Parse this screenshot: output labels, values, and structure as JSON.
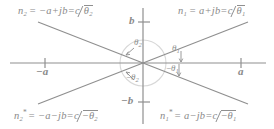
{
  "figure": {
    "type": "complex-plane-diagram",
    "ink_color": "#8a8a8a",
    "axis_color": "#8f8f8f",
    "arc_color": "#cfcfcf",
    "background": "#ffffff"
  },
  "axes": {
    "real_axis_label": "",
    "imag_axis_label": "",
    "origin": {
      "x": 143,
      "y": 63
    },
    "ticks": {
      "right": "a",
      "left": "−a",
      "top": "b",
      "bottom": "−b"
    }
  },
  "quadrant_labels": {
    "top_right": {
      "symbol": "n",
      "sub": "1",
      "star": "",
      "expr": "= a+jb=c",
      "angle": "θ",
      "angle_sub": "1",
      "angle_sign": "",
      "full_text": "n₁ = a+jb = c ∠θ₁"
    },
    "top_left": {
      "symbol": "n",
      "sub": "2",
      "star": "",
      "expr": "= −a+jb=c",
      "angle": "θ",
      "angle_sub": "2",
      "angle_sign": "",
      "full_text": "n₂ = −a+jb = c ∠θ₂"
    },
    "bottom_right": {
      "symbol": "n",
      "sub": "1",
      "star": "*",
      "expr": "= a−jb=c",
      "angle": "θ",
      "angle_sub": "1",
      "angle_sign": "−",
      "full_text": "n₁* = a−jb = c ∠−θ₁"
    },
    "bottom_left": {
      "symbol": "n",
      "sub": "2",
      "star": "*",
      "expr": "= −a−jb=c",
      "angle": "θ",
      "angle_sub": "2",
      "angle_sign": "−",
      "full_text": "n₂* = −a−jb = c ∠−θ₂"
    }
  },
  "angle_markers": {
    "theta1": {
      "text": "θ",
      "sub": "1",
      "sign": ""
    },
    "theta2": {
      "text": "θ",
      "sub": "2",
      "sign": ""
    },
    "neg_theta1": {
      "text": "θ",
      "sub": "1",
      "sign": "−"
    },
    "neg_theta2": {
      "text": "θ",
      "sub": "2",
      "sign": "−"
    }
  }
}
